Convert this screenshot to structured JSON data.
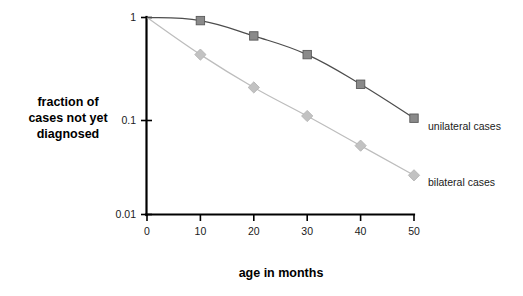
{
  "chart_data": {
    "type": "line",
    "title": "",
    "xlabel": "age in months",
    "ylabel": "fraction of cases not yet diagnosed",
    "ylabel_lines": [
      "fraction of",
      "cases not yet",
      "diagnosed"
    ],
    "x": [
      0,
      10,
      20,
      30,
      40,
      50
    ],
    "xticklabels": [
      "0",
      "10",
      "20",
      "30",
      "40",
      "50"
    ],
    "xlim": [
      0,
      52
    ],
    "yticks": [
      1,
      0.1,
      0.01
    ],
    "yticklabels": [
      "1",
      "0.1",
      "0.01"
    ],
    "ylim": [
      0.01,
      1
    ],
    "yscale": "log",
    "grid": false,
    "legend_position": "right-of-axes-inline",
    "series": [
      {
        "name": "unilateral cases",
        "marker": "square",
        "color": "#8a8a8a",
        "line_color": "#4d4d4d",
        "label_x": 50,
        "values": [
          1.0,
          0.93,
          0.65,
          0.42,
          0.21,
          0.095
        ]
      },
      {
        "name": "bilateral cases",
        "marker": "diamond",
        "color": "#c2c2c2",
        "line_color": "#bdbdbd",
        "label_x": 50,
        "values": [
          1.0,
          0.42,
          0.195,
          0.1,
          0.05,
          0.025
        ]
      }
    ]
  },
  "colors": {
    "background": "#ffffff",
    "axis": "#000000",
    "text": "#1a1a1a",
    "unilateral": "#8a8a8a",
    "bilateral": "#c2c2c2"
  }
}
